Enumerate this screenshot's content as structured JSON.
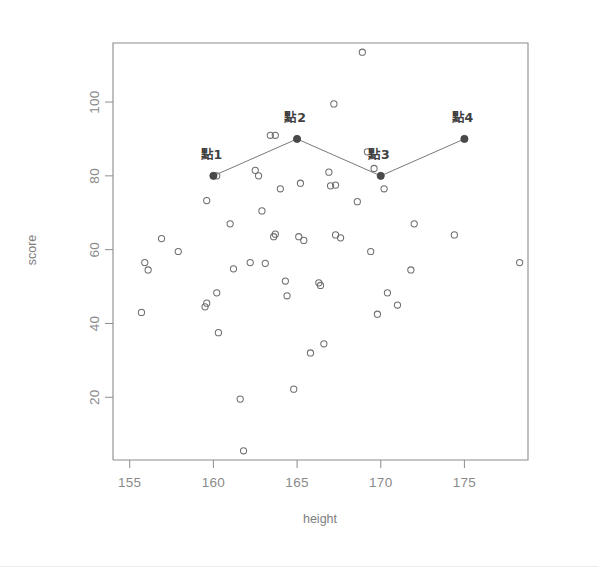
{
  "chart_data": {
    "type": "scatter",
    "title": "",
    "xlabel": "height",
    "ylabel": "score",
    "xlim": [
      154.0,
      178.8
    ],
    "ylim": [
      3.0,
      116.0
    ],
    "grid": false,
    "legend": "none",
    "xticks": [
      155,
      160,
      165,
      170,
      175
    ],
    "yticks": [
      20,
      40,
      60,
      80,
      100
    ],
    "xtick_labels": [
      "155",
      "160",
      "165",
      "170",
      "175"
    ],
    "ytick_labels": [
      "20",
      "40",
      "60",
      "80",
      "100"
    ],
    "series": [
      {
        "name": "observations",
        "marker": "open-circle",
        "color": "#6e6e6e",
        "points": [
          {
            "x": 155.9,
            "y": 56.5
          },
          {
            "x": 156.1,
            "y": 54.5
          },
          {
            "x": 155.7,
            "y": 43.0
          },
          {
            "x": 156.9,
            "y": 63.0
          },
          {
            "x": 157.9,
            "y": 59.5
          },
          {
            "x": 159.6,
            "y": 73.3
          },
          {
            "x": 159.6,
            "y": 45.5
          },
          {
            "x": 159.5,
            "y": 44.5
          },
          {
            "x": 160.2,
            "y": 80.0
          },
          {
            "x": 160.2,
            "y": 48.3
          },
          {
            "x": 160.3,
            "y": 37.5
          },
          {
            "x": 161.0,
            "y": 67.0
          },
          {
            "x": 161.2,
            "y": 54.8
          },
          {
            "x": 161.6,
            "y": 19.5
          },
          {
            "x": 161.8,
            "y": 5.5
          },
          {
            "x": 162.2,
            "y": 56.5
          },
          {
            "x": 162.5,
            "y": 81.5
          },
          {
            "x": 162.7,
            "y": 80.0
          },
          {
            "x": 162.9,
            "y": 70.5
          },
          {
            "x": 163.1,
            "y": 56.3
          },
          {
            "x": 163.4,
            "y": 91.0
          },
          {
            "x": 163.7,
            "y": 91.0
          },
          {
            "x": 163.6,
            "y": 63.5
          },
          {
            "x": 163.7,
            "y": 64.2
          },
          {
            "x": 164.0,
            "y": 76.5
          },
          {
            "x": 164.3,
            "y": 51.5
          },
          {
            "x": 164.4,
            "y": 47.5
          },
          {
            "x": 164.8,
            "y": 22.2
          },
          {
            "x": 165.2,
            "y": 78.0
          },
          {
            "x": 165.4,
            "y": 62.5
          },
          {
            "x": 165.1,
            "y": 63.5
          },
          {
            "x": 165.8,
            "y": 32.0
          },
          {
            "x": 166.3,
            "y": 51.0
          },
          {
            "x": 166.4,
            "y": 50.3
          },
          {
            "x": 166.6,
            "y": 34.5
          },
          {
            "x": 166.9,
            "y": 81.0
          },
          {
            "x": 167.2,
            "y": 99.5
          },
          {
            "x": 167.0,
            "y": 77.3
          },
          {
            "x": 167.3,
            "y": 77.5
          },
          {
            "x": 167.3,
            "y": 64.0
          },
          {
            "x": 167.6,
            "y": 63.2
          },
          {
            "x": 168.6,
            "y": 73.0
          },
          {
            "x": 168.9,
            "y": 113.5
          },
          {
            "x": 169.2,
            "y": 86.5
          },
          {
            "x": 169.4,
            "y": 59.5
          },
          {
            "x": 169.6,
            "y": 82.0
          },
          {
            "x": 169.8,
            "y": 42.5
          },
          {
            "x": 170.2,
            "y": 76.5
          },
          {
            "x": 170.4,
            "y": 48.3
          },
          {
            "x": 171.0,
            "y": 45.0
          },
          {
            "x": 171.8,
            "y": 54.5
          },
          {
            "x": 172.0,
            "y": 67.0
          },
          {
            "x": 174.4,
            "y": 64.0
          },
          {
            "x": 178.3,
            "y": 56.5
          }
        ]
      },
      {
        "name": "selected-points",
        "marker": "filled-circle",
        "color": "#4a4a4a",
        "connected": true,
        "points": [
          {
            "x": 160,
            "y": 80,
            "label": "點1"
          },
          {
            "x": 165,
            "y": 90,
            "label": "點2"
          },
          {
            "x": 170,
            "y": 80,
            "label": "點3"
          },
          {
            "x": 175,
            "y": 90,
            "label": "點4"
          }
        ]
      }
    ]
  },
  "labels": {
    "point1": "點1",
    "point2": "點2",
    "point3": "點3",
    "point4": "點4"
  },
  "colors": {
    "axis": "#8d8d8d",
    "point_stroke": "#6e6e6e",
    "marked_fill": "#4a4a4a",
    "line": "#7a7a7a",
    "tick_text": "#8a8a8a",
    "background": "#ffffff"
  }
}
